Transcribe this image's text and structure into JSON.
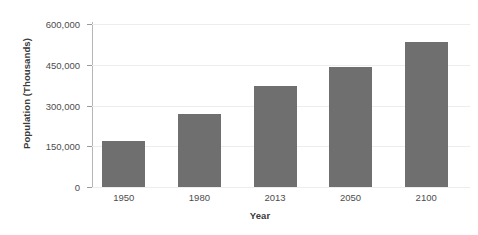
{
  "chart_data": {
    "type": "bar",
    "title": "",
    "xlabel": "Year",
    "ylabel": "Population (Thousands)",
    "categories": [
      "1950",
      "1980",
      "2013",
      "2050",
      "2100"
    ],
    "values": [
      170000,
      270000,
      370000,
      440000,
      535000
    ],
    "series": [
      {
        "name": "Population",
        "values": [
          170000,
          270000,
          370000,
          440000,
          535000
        ]
      }
    ],
    "ylim": [
      0,
      600000
    ],
    "y_ticks": [
      0,
      150000,
      300000,
      450000,
      600000
    ],
    "y_tick_labels": [
      "0",
      "150,000",
      "300,000",
      "450,000",
      "600,000"
    ],
    "x_tick_labels": [
      "1950",
      "1980",
      "2013",
      "2050",
      "2100"
    ],
    "grid": true,
    "grid_axis": "y",
    "legend": false,
    "legend_position": "none",
    "bar_color": "#6f6f6f",
    "grid_color": "#ededed",
    "axis_color": "#b6b6b6",
    "text_color": "#4d4d4d",
    "title_color": "#3b3b3b",
    "background": "#ffffff"
  }
}
